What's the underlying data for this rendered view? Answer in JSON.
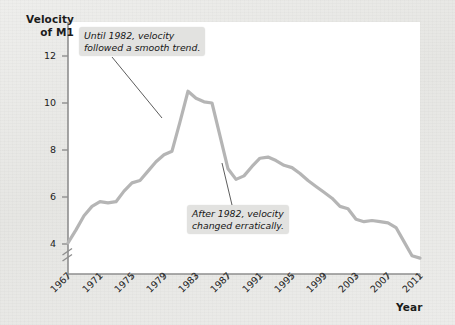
{
  "figure": {
    "background_color": "#eaeae8",
    "plot_background_color": "#ffffff",
    "line_color": "#b5b5b5",
    "axis_color": "#8a8a8a",
    "text_color": "#1b1b1b"
  },
  "axes": {
    "y_title_line1": "Velocity",
    "y_title_line2": "of M1",
    "x_title": "Year",
    "y_ticks": [
      "4",
      "6",
      "8",
      "10",
      "12"
    ],
    "x_ticks": [
      "1967",
      "1971",
      "1975",
      "1979",
      "1983",
      "1987",
      "1991",
      "1995",
      "1999",
      "2003",
      "2007",
      "2011"
    ],
    "y_axis_break": "axis-break-mark"
  },
  "annotations": [
    {
      "id": "callout-1",
      "line1": "Until 1982, velocity",
      "line2": "followed a smooth trend."
    },
    {
      "id": "callout-2",
      "line1": "After 1982, velocity",
      "line2": "changed erratically."
    }
  ],
  "chart_data": {
    "type": "line",
    "title": "",
    "xlabel": "Year",
    "ylabel": "Velocity of M1",
    "xlim": [
      1967,
      2011
    ],
    "ylim": [
      3.0,
      12.6
    ],
    "grid": false,
    "legend": "none",
    "y_axis_broken_below": 4,
    "series": [
      {
        "name": "Velocity of M1",
        "x": [
          1967,
          1968,
          1969,
          1970,
          1971,
          1972,
          1973,
          1974,
          1975,
          1976,
          1977,
          1978,
          1979,
          1980,
          1981,
          1982,
          1983,
          1984,
          1985,
          1986,
          1987,
          1988,
          1989,
          1990,
          1991,
          1992,
          1993,
          1994,
          1995,
          1996,
          1997,
          1998,
          1999,
          2000,
          2001,
          2002,
          2003,
          2004,
          2005,
          2006,
          2007,
          2008,
          2009,
          2010,
          2011
        ],
        "values": [
          4.05,
          4.6,
          5.2,
          5.6,
          5.8,
          5.75,
          5.8,
          6.25,
          6.6,
          6.7,
          7.1,
          7.5,
          7.8,
          7.95,
          9.2,
          10.5,
          10.2,
          10.05,
          10.0,
          8.6,
          7.2,
          6.75,
          6.9,
          7.3,
          7.65,
          7.7,
          7.55,
          7.35,
          7.25,
          7.0,
          6.7,
          6.45,
          6.2,
          5.95,
          5.6,
          5.5,
          5.05,
          4.95,
          5.0,
          4.95,
          4.9,
          4.7,
          4.1,
          3.5,
          3.4
        ]
      }
    ],
    "annotations": [
      {
        "text": "Until 1982, velocity followed a smooth trend.",
        "points_to_x": 1977.5,
        "points_to_y": 9.15
      },
      {
        "text": "After 1982, velocity changed erratically.",
        "points_to_x": 1986.6,
        "points_to_y": 6.75
      }
    ]
  }
}
